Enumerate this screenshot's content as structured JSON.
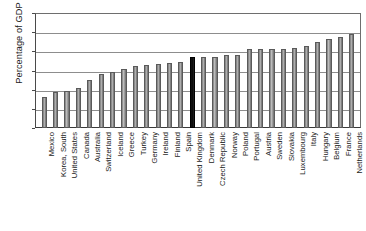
{
  "chart_data": {
    "type": "bar",
    "title": "",
    "xlabel": "",
    "ylabel": "Percentage of GDP",
    "ylim": [
      0,
      60
    ],
    "yticks": [
      0,
      10,
      20,
      30,
      40,
      50,
      60
    ],
    "ytick_labels": [
      "0",
      "10",
      "20",
      "30",
      "40",
      "50",
      "60"
    ],
    "grid": true,
    "legend": "none",
    "highlight_category": "United Kingdom",
    "highlight_color": "#000000",
    "bar_color": "#8a8a8a",
    "categories": [
      "Mexico",
      "Korea, South",
      "United States",
      "Canada",
      "Australia",
      "Switzerland",
      "Iceland",
      "Greece",
      "Turkey",
      "Germany",
      "Ireland",
      "Finland",
      "Spain",
      "United Kingdom",
      "Denmark",
      "Czech Republic",
      "Norway",
      "Poland",
      "Portugal",
      "Austria",
      "Sweden",
      "Slovakia",
      "Luxembourg",
      "Italy",
      "Hungary",
      "Belgium",
      "France",
      "Netherlands"
    ],
    "values": [
      16.2,
      18.9,
      19.3,
      21.0,
      24.8,
      28.2,
      29.1,
      31.0,
      32.5,
      32.7,
      33.3,
      33.8,
      34.6,
      36.9,
      36.8,
      36.8,
      38.1,
      38.1,
      41.0,
      41.2,
      41.3,
      41.3,
      41.7,
      42.8,
      44.9,
      46.4,
      47.4,
      48.8
    ]
  }
}
